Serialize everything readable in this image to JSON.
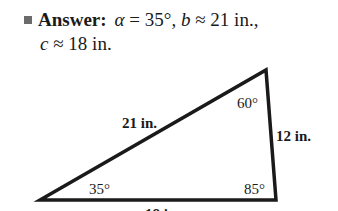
{
  "answer": {
    "bullet_icon": "square-bullet",
    "label": "Answer:",
    "alpha_sym": "α",
    "alpha_val": " = 35°, ",
    "b_sym": "b",
    "b_val": " ≈ 21 in.,",
    "c_sym": "c",
    "c_val": " ≈ 18 in."
  },
  "triangle": {
    "vertices": {
      "bottom_left": [
        40,
        200
      ],
      "top": [
        266,
        70
      ],
      "bottom_right": [
        276,
        200
      ]
    },
    "side_labels": {
      "hypotenuse": "21 in.",
      "right_side": "12 in.",
      "bottom": "18 in."
    },
    "angle_labels": {
      "bottom_left": "35°",
      "top": "60°",
      "bottom_right": "85°"
    },
    "stroke_color": "#1a1a1a"
  }
}
